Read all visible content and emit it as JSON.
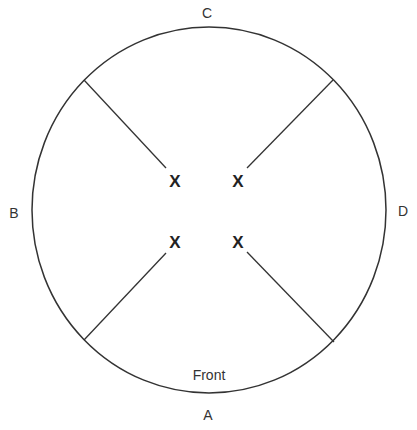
{
  "diagram": {
    "labels": {
      "top": "C",
      "left": "B",
      "right": "D",
      "bottom": "A",
      "front": "Front"
    },
    "marks": [
      "X",
      "X",
      "X",
      "X"
    ],
    "colors": {
      "stroke": "#333333",
      "text": "#333333",
      "background": "#ffffff"
    }
  }
}
